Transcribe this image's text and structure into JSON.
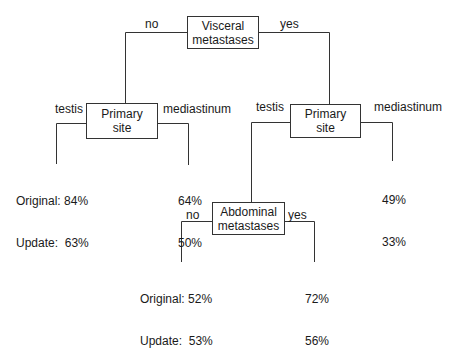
{
  "diagram": {
    "type": "decision-tree",
    "line_color": "#333333",
    "root": {
      "line1": "Visceral",
      "line2": "metastases",
      "edge_left": "no",
      "edge_right": "yes"
    },
    "left_node": {
      "line1": "Primary",
      "line2": "site",
      "edge_left": "testis",
      "edge_right": "mediastinum",
      "leaf_left": {
        "original_label": "Original:",
        "original_value": "84%",
        "update_label": "Update:",
        "update_value": "63%"
      },
      "leaf_right": {
        "original_value": "64%",
        "update_value": "50%"
      }
    },
    "right_node": {
      "line1": "Primary",
      "line2": "site",
      "edge_left": "testis",
      "edge_right": "mediastinum",
      "leaf_right": {
        "original_value": "49%",
        "update_value": "33%"
      }
    },
    "abdominal_node": {
      "line1": "Abdominal",
      "line2": "metastases",
      "edge_left": "no",
      "edge_right": "yes",
      "leaf_left": {
        "original_label": "Original:",
        "original_value": "52%",
        "update_label": "Update:",
        "update_value": "53%"
      },
      "leaf_right": {
        "original_value": "72%",
        "update_value": "56%"
      }
    }
  }
}
